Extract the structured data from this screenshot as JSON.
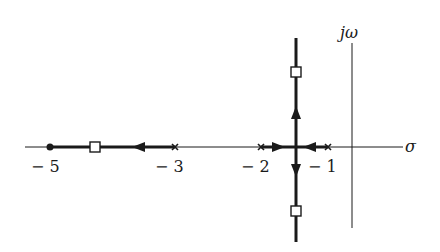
{
  "diagram": {
    "type": "root-locus",
    "axes": {
      "real_axis_label": "σ",
      "imag_axis_label": "jω"
    },
    "tick_labels": [
      {
        "value": -5,
        "text": "− 5"
      },
      {
        "value": -3,
        "text": "− 3"
      },
      {
        "value": -2,
        "text": "− 2"
      },
      {
        "value": -1,
        "text": "− 1"
      }
    ],
    "poles": [
      -3,
      -2,
      -1
    ],
    "zeros": [
      -5
    ],
    "closed_loop_poles_markers": [
      {
        "location": "real axis between -5 and -3",
        "shape": "square"
      },
      {
        "location": "upper branch",
        "shape": "square"
      },
      {
        "location": "lower branch",
        "shape": "square"
      }
    ],
    "branches": [
      {
        "from": "pole -3",
        "to": "zero -5",
        "direction": "left"
      },
      {
        "from": "pole -2",
        "to": "breakaway",
        "direction": "right"
      },
      {
        "from": "pole -1",
        "to": "breakaway",
        "direction": "left"
      },
      {
        "from": "breakaway",
        "to": "+j infinity",
        "direction": "up"
      },
      {
        "from": "breakaway",
        "to": "-j infinity",
        "direction": "down"
      }
    ],
    "colors": {
      "ink": "#1a1a1a",
      "background": "#ffffff"
    }
  }
}
